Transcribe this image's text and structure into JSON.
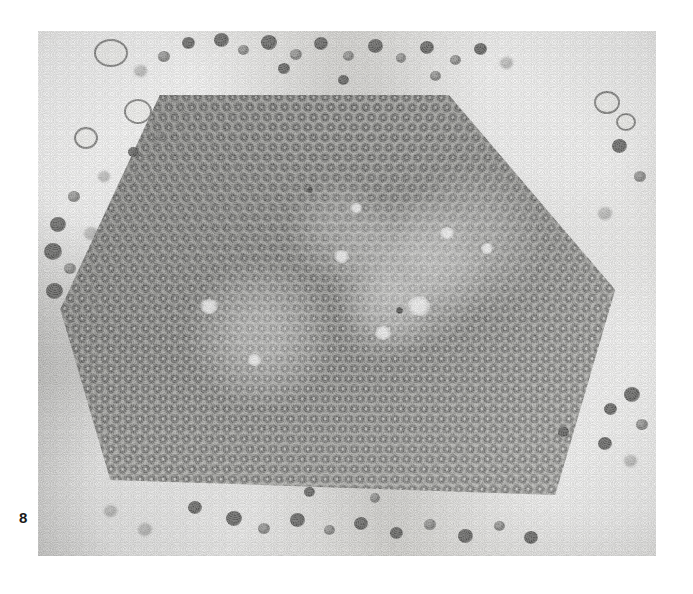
{
  "figure": {
    "number_label": "8",
    "caption_present": false
  },
  "micrograph": {
    "name": "electron-micrograph",
    "modality": "transmission electron microscopy",
    "subject": "hexagonal paracrystalline array of virus particles in cytoplasm",
    "plate": {
      "x": 38,
      "y": 31,
      "width": 618,
      "height": 525
    },
    "tone": {
      "background_page": "#ffffff",
      "cytoplasm_light": "#d9d8d4",
      "cytoplasm_mid": "#c2c2be",
      "crystal_mid": "#b4b4b0",
      "particle_dark": "#3a3a38",
      "granule_dark": "#484846",
      "label_text": "#1a1a1a"
    },
    "crystal": {
      "shape": "hexagon",
      "lattice": "hexagonal close packed",
      "spacing_px": 11.6,
      "particle_form": "ring / annular capsid with electron-lucent core",
      "vertices_percent": [
        [
          19.7,
          12.2
        ],
        [
          66.5,
          12.2
        ],
        [
          93.4,
          49.3
        ],
        [
          83.7,
          88.4
        ],
        [
          11.7,
          85.5
        ],
        [
          3.6,
          53.0
        ]
      ]
    },
    "surround": {
      "features": [
        "free virions",
        "ribosome-like granules",
        "membrane vesicles",
        "ground cytoplasm"
      ],
      "vesicles": [
        {
          "x": 56,
          "y": 8,
          "d": 30
        },
        {
          "x": 86,
          "y": 68,
          "d": 24
        },
        {
          "x": 36,
          "y": 96,
          "d": 20
        },
        {
          "x": 556,
          "y": 60,
          "d": 22
        },
        {
          "x": 570,
          "y": 78,
          "d": 16
        }
      ]
    }
  }
}
